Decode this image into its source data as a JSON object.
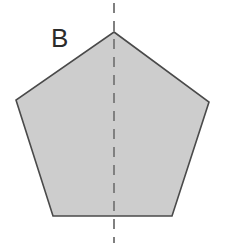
{
  "figure": {
    "label": "B",
    "shape_name": "pentagon",
    "background_color": "#ffffff",
    "fill_color": "#cdcdcd",
    "stroke_color": "#4a4a4a",
    "stroke_width": 1.6,
    "symmetry_line": {
      "name": "vertical-line-of-symmetry",
      "style": "dashed",
      "color": "#808080",
      "width": 2,
      "dash_length": 10,
      "dash_gap": 8,
      "x": 114,
      "y_start": 3,
      "y_end": 243
    },
    "vertices": [
      {
        "name": "apex",
        "x": 114,
        "y": 32
      },
      {
        "name": "right-upper",
        "x": 209,
        "y": 102
      },
      {
        "name": "right-lower",
        "x": 172,
        "y": 216
      },
      {
        "name": "left-lower",
        "x": 53,
        "y": 216
      },
      {
        "name": "left-upper",
        "x": 16,
        "y": 100
      }
    ],
    "label_position": {
      "x": 51,
      "y": 25
    }
  }
}
